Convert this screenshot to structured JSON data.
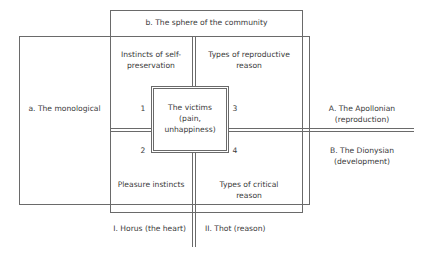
{
  "diagram": {
    "community_label": "b. The sphere of the community",
    "monological_label": "a. The monological",
    "apollonian_label": {
      "line1": "A. The Apollonian",
      "line2": "(reproduction)"
    },
    "dionysian_label": {
      "line1": "B. The Dionysian",
      "line2": "(development)"
    },
    "quadrants": {
      "top_left": {
        "line1": "Instincts of self-",
        "line2": "preservation",
        "number": "1"
      },
      "top_right": {
        "line1": "Types of reproductive",
        "line2": "reason",
        "number": "3"
      },
      "bottom_left": {
        "line1": "Pleasure instincts",
        "number": "2"
      },
      "bottom_right": {
        "line1": "Types of critical",
        "line2": "reason",
        "number": "4"
      }
    },
    "center": {
      "line1": "The victims",
      "line2": "(pain,",
      "line3": "unhappiness)"
    },
    "bottom_labels": {
      "left": "I. Horus (the heart)",
      "right": "II. Thot (reason)"
    },
    "colors": {
      "line": "#6a6a6a",
      "text": "#3a3a3a",
      "background": "#ffffff"
    }
  }
}
